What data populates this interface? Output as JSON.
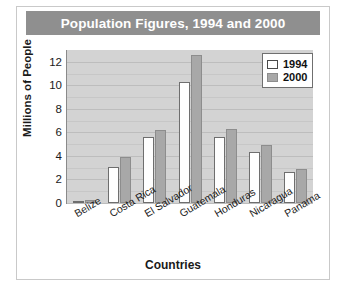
{
  "chart_data": {
    "type": "bar",
    "title": "Population Figures, 1994 and 2000",
    "xlabel": "Countries",
    "ylabel": "Millions of People",
    "categories": [
      "Belize",
      "Costa Rica",
      "El Salvador",
      "Guatemala",
      "Honduras",
      "Nicaragua",
      "Panama"
    ],
    "series": [
      {
        "name": "1994",
        "values": [
          0.2,
          3.1,
          5.6,
          10.3,
          5.6,
          4.3,
          2.6
        ],
        "color": "#ffffff"
      },
      {
        "name": "2000",
        "values": [
          0.25,
          3.9,
          6.2,
          12.6,
          6.3,
          4.9,
          2.9
        ],
        "color": "#a8a8a8"
      }
    ],
    "ylim": [
      0,
      13
    ],
    "yticks": [
      0,
      2,
      4,
      6,
      8,
      10,
      12
    ],
    "ytick_labels": [
      "0",
      "2",
      "4",
      "6",
      "8",
      "10",
      "12"
    ],
    "grid": true,
    "grid_axis": "y",
    "legend_position": "upper right",
    "plot_background": "#d3d3d3",
    "title_background": "#8f8f8f",
    "title_color": "#ffffff"
  }
}
